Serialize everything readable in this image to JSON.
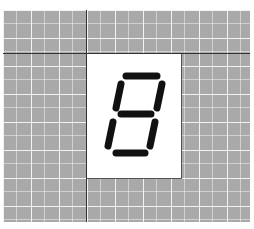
{
  "display": {
    "digit": "8",
    "segments_lit": {
      "a": true,
      "b": true,
      "c": true,
      "d": true,
      "e": true,
      "f": true,
      "g": true
    },
    "segment_color": "#111111",
    "panel_color": "#ffffff",
    "grid_color": "#a9a9a9"
  }
}
